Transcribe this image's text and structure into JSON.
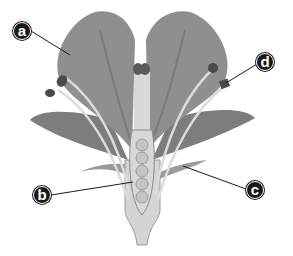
{
  "diagram": {
    "labels": [
      {
        "id": "a",
        "text": "a",
        "x": 13,
        "y": 22,
        "points_to": "petal"
      },
      {
        "id": "b",
        "text": "b",
        "x": 33,
        "y": 186,
        "points_to": "style / ovary wall"
      },
      {
        "id": "c",
        "text": "c",
        "x": 246,
        "y": 181,
        "points_to": "sepal"
      },
      {
        "id": "d",
        "text": "d",
        "x": 256,
        "y": 53,
        "points_to": "anther"
      }
    ],
    "colors": {
      "petal": "#8f8f8f",
      "petal_dark": "#6e6e6e",
      "pistil": "#d8d8d8",
      "ovule": "#c4c4c4",
      "anther": "#4a4a4a",
      "label_bg": "#1a1a1a",
      "label_text": "#ffffff",
      "leader_line": "#1a1a1a"
    }
  }
}
